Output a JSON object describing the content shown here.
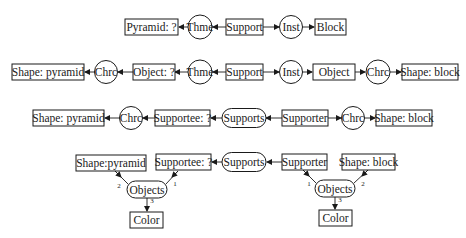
{
  "diagram": {
    "type": "conceptual-graph",
    "colors": {
      "ink": "#1a1a1a",
      "background": "#ffffff"
    },
    "rows": [
      {
        "id": "row1",
        "nodes": [
          {
            "id": "r1-pyramid",
            "label": "Pyramid: ?",
            "shape": "rect"
          },
          {
            "id": "r1-thme",
            "label": "Thme",
            "shape": "circle"
          },
          {
            "id": "r1-support",
            "label": "Support",
            "shape": "rect"
          },
          {
            "id": "r1-inst",
            "label": "Inst",
            "shape": "circle"
          },
          {
            "id": "r1-block",
            "label": "Block",
            "shape": "rect"
          }
        ],
        "edges": [
          {
            "from": "r1-support",
            "to": "r1-thme"
          },
          {
            "from": "r1-thme",
            "to": "r1-pyramid"
          },
          {
            "from": "r1-support",
            "to": "r1-inst"
          },
          {
            "from": "r1-inst",
            "to": "r1-block"
          }
        ]
      },
      {
        "id": "row2",
        "nodes": [
          {
            "id": "r2-shape-pyramid",
            "label": "Shape: pyramid",
            "shape": "rect"
          },
          {
            "id": "r2-chrc-left",
            "label": "Chrc",
            "shape": "circle"
          },
          {
            "id": "r2-object-q",
            "label": "Object: ?",
            "shape": "rect"
          },
          {
            "id": "r2-thme",
            "label": "Thme",
            "shape": "circle"
          },
          {
            "id": "r2-support",
            "label": "Support",
            "shape": "rect"
          },
          {
            "id": "r2-inst",
            "label": "Inst",
            "shape": "circle"
          },
          {
            "id": "r2-object",
            "label": "Object",
            "shape": "rect"
          },
          {
            "id": "r2-chrc-right",
            "label": "Chrc",
            "shape": "circle"
          },
          {
            "id": "r2-shape-block",
            "label": "Shape: block",
            "shape": "rect"
          }
        ]
      },
      {
        "id": "row3",
        "nodes": [
          {
            "id": "r3-shape-pyramid",
            "label": "Shape: pyramid",
            "shape": "rect"
          },
          {
            "id": "r3-chrc-left",
            "label": "Chrc",
            "shape": "circle"
          },
          {
            "id": "r3-supportee",
            "label": "Supportee: ?",
            "shape": "rect"
          },
          {
            "id": "r3-supports",
            "label": "Supports",
            "shape": "rounded"
          },
          {
            "id": "r3-supporter",
            "label": "Supporter",
            "shape": "rect"
          },
          {
            "id": "r3-chrc-right",
            "label": "Chrc",
            "shape": "circle"
          },
          {
            "id": "r3-shape-block",
            "label": "Shape: block",
            "shape": "rect"
          }
        ]
      },
      {
        "id": "row4",
        "nodes": [
          {
            "id": "r4-shape-pyramid",
            "label": "Shape:pyramid",
            "shape": "rect"
          },
          {
            "id": "r4-supportee",
            "label": "Supportee: ?",
            "shape": "rect"
          },
          {
            "id": "r4-supports",
            "label": "Supports",
            "shape": "rounded"
          },
          {
            "id": "r4-supporter",
            "label": "Supporter",
            "shape": "rect"
          },
          {
            "id": "r4-shape-block",
            "label": "Shape: block",
            "shape": "rect"
          },
          {
            "id": "r4-objects-left",
            "label": "Objects",
            "shape": "rounded"
          },
          {
            "id": "r4-color-left",
            "label": "Color",
            "shape": "rect"
          },
          {
            "id": "r4-objects-right",
            "label": "Objects",
            "shape": "rounded"
          },
          {
            "id": "r4-color-right",
            "label": "Color",
            "shape": "rect"
          }
        ],
        "edge_labels": {
          "left_from_supportee": "1",
          "left_from_shape": "2",
          "left_to_color": "3",
          "right_from_supporter": "1",
          "right_from_shape": "2",
          "right_to_color": "3"
        }
      }
    ]
  }
}
